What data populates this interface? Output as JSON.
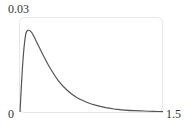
{
  "chart_data": {
    "type": "line",
    "title": "",
    "xlabel": "",
    "ylabel": "",
    "xlim": [
      0,
      1.5
    ],
    "ylim": [
      0,
      0.03
    ],
    "x_tick_labels": [
      "0",
      "1.5"
    ],
    "y_tick_labels": [
      "0",
      "0.03"
    ],
    "grid": false,
    "legend": null,
    "series": [
      {
        "name": "density",
        "color": "#555555",
        "x": [
          0.0,
          0.03,
          0.06,
          0.09,
          0.12,
          0.15,
          0.2,
          0.3,
          0.4,
          0.5,
          0.6,
          0.7,
          0.8,
          0.9,
          1.0,
          1.1,
          1.2,
          1.3,
          1.4,
          1.5
        ],
        "y": [
          0.0,
          0.016,
          0.0245,
          0.0258,
          0.0252,
          0.0236,
          0.0205,
          0.0147,
          0.01,
          0.0067,
          0.0045,
          0.0031,
          0.0021,
          0.0014,
          0.0009,
          0.0006,
          0.0004,
          0.0003,
          0.0002,
          0.0001
        ]
      }
    ]
  },
  "labels": {
    "y_max": "0.03",
    "y_min": "0",
    "x_max": "1.5"
  },
  "colors": {
    "frame": "#e6e6e6",
    "line": "#555555",
    "text": "#333333"
  }
}
